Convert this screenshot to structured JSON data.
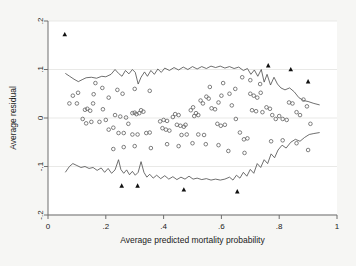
{
  "figure": {
    "name": "average-residual-vs-predicted-mortality",
    "background_color": "#f6f6f4",
    "plot_background_color": "#ffffff"
  },
  "chart_data": {
    "type": "scatter",
    "title": "",
    "subtitle": "",
    "xlabel": "Average predicted mortality probability",
    "ylabel": "Average residual",
    "xlim": [
      0,
      1
    ],
    "ylim": [
      -0.2,
      0.2
    ],
    "xticks": [
      0,
      0.2,
      0.4,
      0.6,
      0.8,
      1
    ],
    "xticklabels": [
      "0",
      ".2",
      ".4",
      ".6",
      ".8",
      "1"
    ],
    "yticks": [
      -0.2,
      -0.1,
      0,
      0.1,
      0.2
    ],
    "yticklabels": [
      "-.2",
      "-.1",
      "0",
      ".1",
      ".2"
    ],
    "grid": true,
    "grid_axis": "y",
    "legend": "none",
    "marker_colors": {
      "circle_stroke": "#606060",
      "triangle_fill": "#111111",
      "band_line": "#4a4a4a"
    },
    "series": [
      {
        "name": "Average residual (hollow circles)",
        "marker": "circle-open",
        "points": [
          [
            0.086,
            0.046
          ],
          [
            0.104,
            0.052
          ],
          [
            0.074,
            0.03
          ],
          [
            0.1,
            0.03
          ],
          [
            0.128,
            0.017
          ],
          [
            0.136,
            0.019
          ],
          [
            0.146,
            0.015
          ],
          [
            0.12,
            -0.002
          ],
          [
            0.132,
            -0.011
          ],
          [
            0.15,
            -0.008
          ],
          [
            0.158,
            0.049
          ],
          [
            0.156,
            0.03
          ],
          [
            0.19,
            0.018
          ],
          [
            0.178,
            -0.008
          ],
          [
            0.2,
            -0.004
          ],
          [
            0.21,
            -0.024
          ],
          [
            0.226,
            -0.02
          ],
          [
            0.232,
            0.006
          ],
          [
            0.25,
            0.003
          ],
          [
            0.244,
            -0.031
          ],
          [
            0.262,
            -0.031
          ],
          [
            0.27,
            0.001
          ],
          [
            0.278,
            -0.012
          ],
          [
            0.292,
            0.01
          ],
          [
            0.3,
            0.011
          ],
          [
            0.306,
            0.008
          ],
          [
            0.316,
            0.01
          ],
          [
            0.322,
            0.016
          ],
          [
            0.33,
            0.013
          ],
          [
            0.292,
            -0.034
          ],
          [
            0.31,
            -0.034
          ],
          [
            0.34,
            -0.031
          ],
          [
            0.352,
            -0.03
          ],
          [
            0.388,
            -0.007
          ],
          [
            0.4,
            -0.004
          ],
          [
            0.412,
            -0.006
          ],
          [
            0.396,
            -0.021
          ],
          [
            0.408,
            -0.024
          ],
          [
            0.42,
            -0.026
          ],
          [
            0.432,
            0.002
          ],
          [
            0.44,
            0.008
          ],
          [
            0.452,
            0.006
          ],
          [
            0.446,
            -0.014
          ],
          [
            0.458,
            -0.016
          ],
          [
            0.47,
            -0.018
          ],
          [
            0.476,
            -0.014
          ],
          [
            0.462,
            -0.035
          ],
          [
            0.48,
            -0.034
          ],
          [
            0.494,
            0.016
          ],
          [
            0.502,
            0.022
          ],
          [
            0.512,
            0.01
          ],
          [
            0.506,
            0.004
          ],
          [
            0.52,
            0.006
          ],
          [
            0.528,
            0.036
          ],
          [
            0.536,
            0.03
          ],
          [
            0.548,
            0.044
          ],
          [
            0.556,
            0.04
          ],
          [
            0.52,
            -0.034
          ],
          [
            0.54,
            -0.035
          ],
          [
            0.566,
            0.02
          ],
          [
            0.578,
            0.018
          ],
          [
            0.59,
            0.032
          ],
          [
            0.6,
            0.046
          ],
          [
            0.586,
            -0.012
          ],
          [
            0.598,
            -0.016
          ],
          [
            0.612,
            -0.014
          ],
          [
            0.628,
            0.05
          ],
          [
            0.636,
            0.026
          ],
          [
            0.65,
            -0.002
          ],
          [
            0.664,
            -0.03
          ],
          [
            0.678,
            -0.044
          ],
          [
            0.69,
            -0.042
          ],
          [
            0.7,
            0.05
          ],
          [
            0.712,
            0.046
          ],
          [
            0.724,
            0.042
          ],
          [
            0.736,
            0.052
          ],
          [
            0.706,
            0.016
          ],
          [
            0.72,
            0.014
          ],
          [
            0.742,
            0.012
          ],
          [
            0.756,
            0.022
          ],
          [
            0.768,
            0.019
          ],
          [
            0.776,
            0.006
          ],
          [
            0.788,
            -0.002
          ],
          [
            0.8,
            0.004
          ],
          [
            0.812,
            -0.002
          ],
          [
            0.826,
            -0.004
          ],
          [
            0.834,
            0.032
          ],
          [
            0.846,
            0.03
          ],
          [
            0.86,
            0.012
          ],
          [
            0.872,
            0.006
          ],
          [
            0.884,
            0.038
          ],
          [
            0.896,
            0.024
          ],
          [
            0.908,
            -0.012
          ],
          [
            0.24,
            0.058
          ],
          [
            0.258,
            0.05
          ],
          [
            0.3,
            0.06
          ],
          [
            0.352,
            0.056
          ],
          [
            0.188,
            0.062
          ],
          [
            0.164,
            0.072
          ],
          [
            0.21,
            0.042
          ],
          [
            0.56,
            0.064
          ],
          [
            0.606,
            0.072
          ],
          [
            0.648,
            0.06
          ],
          [
            0.672,
            0.084
          ],
          [
            0.7,
            0.078
          ],
          [
            0.734,
            0.07
          ],
          [
            0.5,
            -0.052
          ],
          [
            0.546,
            -0.054
          ],
          [
            0.59,
            -0.056
          ],
          [
            0.412,
            -0.054
          ],
          [
            0.452,
            -0.058
          ],
          [
            0.356,
            -0.062
          ],
          [
            0.262,
            -0.06
          ],
          [
            0.3,
            -0.058
          ],
          [
            0.226,
            -0.064
          ],
          [
            0.772,
            -0.048
          ],
          [
            0.812,
            -0.046
          ],
          [
            0.86,
            -0.052
          ],
          [
            0.9,
            -0.066
          ],
          [
            0.624,
            -0.068
          ],
          [
            0.68,
            -0.072
          ]
        ]
      },
      {
        "name": "Outlier markers (filled triangles)",
        "marker": "triangle-filled",
        "points": [
          [
            0.058,
            0.172
          ],
          [
            0.762,
            0.108
          ],
          [
            0.84,
            0.1
          ],
          [
            0.9,
            0.075
          ],
          [
            0.255,
            -0.14
          ],
          [
            0.31,
            -0.14
          ],
          [
            0.47,
            -0.148
          ],
          [
            0.655,
            -0.152
          ]
        ]
      },
      {
        "name": "Upper confidence band",
        "marker": "line",
        "points": [
          [
            0.06,
            0.092
          ],
          [
            0.075,
            0.086
          ],
          [
            0.09,
            0.08
          ],
          [
            0.105,
            0.075
          ],
          [
            0.118,
            0.079
          ],
          [
            0.132,
            0.083
          ],
          [
            0.15,
            0.084
          ],
          [
            0.168,
            0.082
          ],
          [
            0.186,
            0.086
          ],
          [
            0.2,
            0.085
          ],
          [
            0.218,
            0.09
          ],
          [
            0.232,
            0.1
          ],
          [
            0.244,
            0.092
          ],
          [
            0.256,
            0.086
          ],
          [
            0.268,
            0.098
          ],
          [
            0.28,
            0.091
          ],
          [
            0.292,
            0.1
          ],
          [
            0.302,
            0.094
          ],
          [
            0.312,
            0.07
          ],
          [
            0.322,
            0.084
          ],
          [
            0.334,
            0.095
          ],
          [
            0.344,
            0.086
          ],
          [
            0.356,
            0.098
          ],
          [
            0.368,
            0.09
          ],
          [
            0.38,
            0.101
          ],
          [
            0.392,
            0.094
          ],
          [
            0.404,
            0.103
          ],
          [
            0.42,
            0.098
          ],
          [
            0.436,
            0.104
          ],
          [
            0.452,
            0.099
          ],
          [
            0.468,
            0.105
          ],
          [
            0.484,
            0.1
          ],
          [
            0.5,
            0.106
          ],
          [
            0.516,
            0.101
          ],
          [
            0.532,
            0.106
          ],
          [
            0.548,
            0.102
          ],
          [
            0.564,
            0.107
          ],
          [
            0.58,
            0.104
          ],
          [
            0.596,
            0.107
          ],
          [
            0.612,
            0.103
          ],
          [
            0.628,
            0.106
          ],
          [
            0.644,
            0.102
          ],
          [
            0.66,
            0.105
          ],
          [
            0.676,
            0.098
          ],
          [
            0.69,
            0.102
          ],
          [
            0.702,
            0.09
          ],
          [
            0.714,
            0.099
          ],
          [
            0.726,
            0.086
          ],
          [
            0.738,
            0.1
          ],
          [
            0.748,
            0.074
          ],
          [
            0.758,
            0.09
          ],
          [
            0.77,
            0.068
          ],
          [
            0.782,
            0.084
          ],
          [
            0.794,
            0.07
          ],
          [
            0.806,
            0.062
          ],
          [
            0.82,
            0.058
          ],
          [
            0.836,
            0.062
          ],
          [
            0.852,
            0.054
          ],
          [
            0.868,
            0.042
          ],
          [
            0.884,
            0.036
          ],
          [
            0.9,
            0.034
          ],
          [
            0.92,
            0.03
          ],
          [
            0.94,
            0.027
          ]
        ]
      },
      {
        "name": "Lower confidence band",
        "marker": "line",
        "points": [
          [
            0.06,
            -0.112
          ],
          [
            0.074,
            -0.1
          ],
          [
            0.086,
            -0.094
          ],
          [
            0.1,
            -0.098
          ],
          [
            0.114,
            -0.102
          ],
          [
            0.128,
            -0.1
          ],
          [
            0.142,
            -0.104
          ],
          [
            0.156,
            -0.102
          ],
          [
            0.17,
            -0.108
          ],
          [
            0.184,
            -0.103
          ],
          [
            0.196,
            -0.112
          ],
          [
            0.208,
            -0.104
          ],
          [
            0.22,
            -0.114
          ],
          [
            0.232,
            -0.107
          ],
          [
            0.244,
            -0.086
          ],
          [
            0.252,
            -0.106
          ],
          [
            0.262,
            -0.114
          ],
          [
            0.272,
            -0.107
          ],
          [
            0.282,
            -0.117
          ],
          [
            0.292,
            -0.11
          ],
          [
            0.302,
            -0.118
          ],
          [
            0.312,
            -0.112
          ],
          [
            0.322,
            -0.09
          ],
          [
            0.332,
            -0.112
          ],
          [
            0.342,
            -0.122
          ],
          [
            0.352,
            -0.116
          ],
          [
            0.364,
            -0.124
          ],
          [
            0.376,
            -0.118
          ],
          [
            0.39,
            -0.125
          ],
          [
            0.404,
            -0.119
          ],
          [
            0.418,
            -0.126
          ],
          [
            0.432,
            -0.121
          ],
          [
            0.446,
            -0.127
          ],
          [
            0.46,
            -0.122
          ],
          [
            0.474,
            -0.126
          ],
          [
            0.488,
            -0.12
          ],
          [
            0.502,
            -0.126
          ],
          [
            0.516,
            -0.124
          ],
          [
            0.532,
            -0.127
          ],
          [
            0.548,
            -0.125
          ],
          [
            0.564,
            -0.128
          ],
          [
            0.58,
            -0.126
          ],
          [
            0.596,
            -0.128
          ],
          [
            0.612,
            -0.126
          ],
          [
            0.628,
            -0.122
          ],
          [
            0.64,
            -0.128
          ],
          [
            0.652,
            -0.118
          ],
          [
            0.664,
            -0.124
          ],
          [
            0.676,
            -0.112
          ],
          [
            0.688,
            -0.12
          ],
          [
            0.7,
            -0.106
          ],
          [
            0.712,
            -0.114
          ],
          [
            0.724,
            -0.094
          ],
          [
            0.736,
            -0.102
          ],
          [
            0.748,
            -0.086
          ],
          [
            0.76,
            -0.094
          ],
          [
            0.772,
            -0.074
          ],
          [
            0.784,
            -0.082
          ],
          [
            0.796,
            -0.066
          ],
          [
            0.81,
            -0.056
          ],
          [
            0.824,
            -0.062
          ],
          [
            0.84,
            -0.05
          ],
          [
            0.856,
            -0.044
          ],
          [
            0.872,
            -0.048
          ],
          [
            0.888,
            -0.04
          ],
          [
            0.904,
            -0.034
          ],
          [
            0.92,
            -0.032
          ],
          [
            0.94,
            -0.03
          ]
        ]
      }
    ]
  }
}
